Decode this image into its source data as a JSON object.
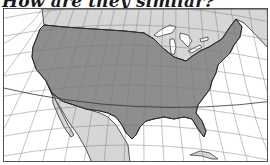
{
  "heading": {
    "text": "How are they similar?"
  },
  "map": {
    "subject": "Contiguous United States",
    "regions": [
      {
        "name": "United States",
        "fill": "#8e8e8e"
      },
      {
        "name": "Canada",
        "fill": "#d6d6d6"
      },
      {
        "name": "Mexico",
        "fill": "#d6d6d6"
      },
      {
        "name": "Water",
        "fill": "#ffffff"
      }
    ],
    "colors": {
      "us_fill": "#8e8e8e",
      "neighbor_fill": "#d6d6d6",
      "water": "#ffffff",
      "coastline": "#2a2a2a",
      "graticule": "#7a7a7a",
      "frame": "#555555"
    },
    "graticule": true
  }
}
